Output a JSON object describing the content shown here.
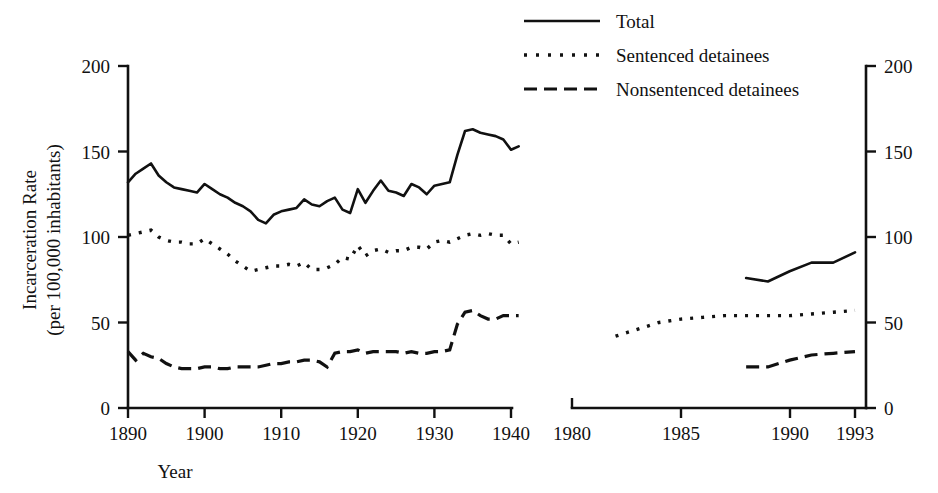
{
  "chart_data": {
    "type": "line",
    "title": "",
    "xlabel": "Year",
    "ylabel": "Incarceration Rate\n(per 100,000 inhabitants)",
    "ylabel_line1": "Incarceration Rate",
    "ylabel_line2": "(per 100,000 inhabitants)",
    "ylim": [
      0,
      200
    ],
    "y_ticks": [
      0,
      50,
      100,
      150,
      200
    ],
    "y_tick_labels": [
      "0",
      "50",
      "100",
      "150",
      "200"
    ],
    "right_axis_ticks": [
      0,
      50,
      100,
      150,
      200
    ],
    "right_axis_tick_labels": [
      "0",
      "50",
      "100",
      "150",
      "200"
    ],
    "grid": false,
    "legend_position": "top-center",
    "axis_break": true,
    "panels": [
      {
        "name": "left-panel",
        "xlim": [
          1890,
          1941
        ],
        "x_ticks": [
          1890,
          1900,
          1910,
          1920,
          1930,
          1940
        ],
        "x_tick_labels": [
          "1890",
          "1900",
          "1910",
          "1920",
          "1930",
          "1940"
        ]
      },
      {
        "name": "right-panel",
        "xlim": [
          1980,
          1993.5
        ],
        "x_ticks": [
          1980,
          1985,
          1990,
          1993
        ],
        "x_tick_labels": [
          "1980",
          "1985",
          "1990",
          "1993"
        ]
      }
    ],
    "legend": [
      {
        "label": "Total",
        "style": "solid"
      },
      {
        "label": "Sentenced detainees",
        "style": "dotted"
      },
      {
        "label": "Nonsentenced detainees",
        "style": "dashed"
      }
    ],
    "series": [
      {
        "name": "Total",
        "style": "solid",
        "panel": "left-panel",
        "x": [
          1890,
          1891,
          1892,
          1893,
          1894,
          1895,
          1896,
          1897,
          1898,
          1899,
          1900,
          1901,
          1902,
          1903,
          1904,
          1905,
          1906,
          1907,
          1908,
          1909,
          1910,
          1911,
          1912,
          1913,
          1914,
          1915,
          1916,
          1917,
          1918,
          1919,
          1920,
          1921,
          1922,
          1923,
          1924,
          1925,
          1926,
          1927,
          1928,
          1929,
          1930,
          1931,
          1932,
          1933,
          1934,
          1935,
          1936,
          1937,
          1938,
          1939,
          1940,
          1941
        ],
        "values": [
          132,
          137,
          140,
          143,
          136,
          132,
          129,
          128,
          127,
          126,
          131,
          128,
          125,
          123,
          120,
          118,
          115,
          110,
          108,
          113,
          115,
          116,
          117,
          122,
          119,
          118,
          121,
          123,
          116,
          114,
          128,
          120,
          127,
          133,
          127,
          126,
          124,
          131,
          129,
          125,
          130,
          131,
          132,
          148,
          162,
          163,
          161,
          160,
          159,
          157,
          151,
          153
        ]
      },
      {
        "name": "Sentenced detainees",
        "style": "dotted",
        "panel": "left-panel",
        "x": [
          1890,
          1891,
          1892,
          1893,
          1894,
          1895,
          1896,
          1897,
          1898,
          1899,
          1900,
          1901,
          1902,
          1903,
          1904,
          1905,
          1906,
          1907,
          1908,
          1909,
          1910,
          1911,
          1912,
          1913,
          1914,
          1915,
          1916,
          1917,
          1918,
          1919,
          1920,
          1921,
          1922,
          1923,
          1924,
          1925,
          1926,
          1927,
          1928,
          1929,
          1930,
          1931,
          1932,
          1933,
          1934,
          1935,
          1936,
          1937,
          1938,
          1939,
          1940,
          1941
        ],
        "values": [
          101,
          102,
          103,
          104,
          100,
          98,
          97,
          97,
          96,
          96,
          99,
          96,
          93,
          90,
          86,
          83,
          80,
          81,
          82,
          83,
          83,
          84,
          83,
          85,
          81,
          81,
          82,
          84,
          88,
          87,
          95,
          89,
          92,
          93,
          91,
          92,
          92,
          94,
          94,
          93,
          97,
          98,
          97,
          99,
          101,
          102,
          101,
          102,
          101,
          101,
          96,
          97
        ]
      },
      {
        "name": "Nonsentenced detainees",
        "style": "dashed",
        "panel": "left-panel",
        "x": [
          1890,
          1891,
          1892,
          1893,
          1894,
          1895,
          1896,
          1897,
          1898,
          1899,
          1900,
          1901,
          1902,
          1903,
          1904,
          1905,
          1906,
          1907,
          1908,
          1909,
          1910,
          1911,
          1912,
          1913,
          1914,
          1915,
          1916,
          1917,
          1918,
          1919,
          1920,
          1921,
          1922,
          1923,
          1924,
          1925,
          1926,
          1927,
          1928,
          1929,
          1930,
          1931,
          1932,
          1933,
          1934,
          1935,
          1936,
          1937,
          1938,
          1939,
          1940,
          1941
        ],
        "values": [
          33,
          28,
          32,
          30,
          29,
          26,
          24,
          23,
          23,
          23,
          24,
          24,
          23,
          23,
          24,
          24,
          24,
          24,
          25,
          26,
          26,
          27,
          27,
          28,
          28,
          27,
          24,
          32,
          33,
          33,
          34,
          32,
          33,
          33,
          33,
          33,
          32,
          33,
          32,
          32,
          33,
          33,
          34,
          49,
          56,
          57,
          54,
          52,
          52,
          54,
          54,
          54
        ]
      },
      {
        "name": "Total",
        "style": "solid",
        "panel": "right-panel",
        "x": [
          1988,
          1989,
          1990,
          1991,
          1992,
          1993
        ],
        "values": [
          76,
          74,
          80,
          85,
          85,
          91
        ]
      },
      {
        "name": "Sentenced detainees",
        "style": "dotted",
        "panel": "right-panel",
        "x": [
          1982,
          1983,
          1984,
          1985,
          1986,
          1987,
          1988,
          1989,
          1990,
          1991,
          1992,
          1993
        ],
        "values": [
          42,
          46,
          50,
          52,
          53,
          54,
          54,
          54,
          54,
          55,
          56,
          57
        ]
      },
      {
        "name": "Nonsentenced detainees",
        "style": "dashed",
        "panel": "right-panel",
        "x": [
          1988,
          1989,
          1990,
          1991,
          1992,
          1993
        ],
        "values": [
          24,
          24,
          28,
          31,
          32,
          33
        ]
      }
    ]
  }
}
